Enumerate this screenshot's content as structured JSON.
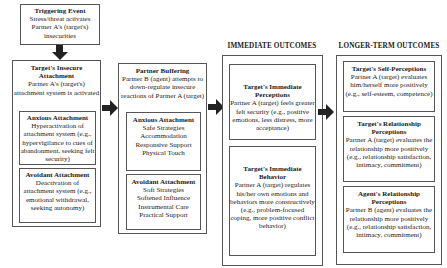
{
  "column_headers": {
    "immediate": "IMMEDIATE OUTCOMES",
    "longer_term": "LONGER-TERM OUTCOMES"
  },
  "triggering_event": {
    "title": "Triggering Event",
    "body": "Stress/threat activates Partner A's (target's) insecurities"
  },
  "insecure_attachment": {
    "title": "Target's Insecure Attachment",
    "body": "Partner A's (target's) attachment system is activated",
    "anxious": {
      "title": "Anxious Attachment",
      "body": "Hyperactivation of attachment system (e.g., hypervigilance to cues of abandonment, seeking felt security)"
    },
    "avoidant": {
      "title": "Avoidant Attachment",
      "body": "Deactivation of attachment system (e.g., emotional withdrawal, seeking autonomy)"
    }
  },
  "partner_buffering": {
    "title": "Partner Buffering",
    "body": "Partner B (agent) attempts to down-regulate insecure reactions of Partner A (target)",
    "anxious": {
      "title": "Anxious Attachment",
      "items": [
        "Safe Strategies",
        "Accommodation",
        "Responsive Support",
        "Physical Touch"
      ]
    },
    "avoidant": {
      "title": "Avoidant Attachment",
      "items": [
        "Soft Strategies",
        "Softened Influence",
        "Instrumental Care",
        "Practical Support"
      ]
    }
  },
  "immediate_outcomes": {
    "perceptions": {
      "title": "Target's Immediate Perceptions",
      "body": "Partner A (target) feels greater felt security (e.g., positive emotions, less distress, more acceptance)"
    },
    "behavior": {
      "title": "Target's Immediate Behavior",
      "body": "Partner A (target) regulates his/her own emotions and behaviors more constructively (e.g., problem-focused coping, more positive conflict behavior)"
    }
  },
  "longer_term_outcomes": {
    "self_perceptions": {
      "title": "Target's Self-Perceptions",
      "body": "Partner A (target) evaluates him/herself more positively (e.g., self-esteem, competence)"
    },
    "relationship_perceptions": {
      "title": "Target's Relationship Perceptions",
      "body": "Partner A (target) evaluates the relationship more positively (e.g., relationship satisfaction, intimacy, commitment)"
    },
    "agent_perceptions": {
      "title": "Agent's Relationship Perceptions",
      "body": "Partner B (agent) evaluates the relationship more positively (e.g., relationship satisfaction, intimacy, commitment)"
    }
  }
}
